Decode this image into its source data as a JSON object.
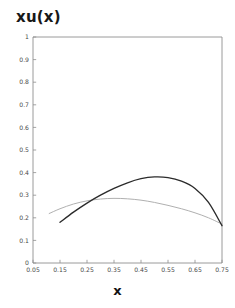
{
  "chart_data": {
    "type": "line",
    "title": "xu(x)",
    "xlabel": "x",
    "ylabel": "",
    "xlim": [
      0.05,
      0.75
    ],
    "ylim": [
      0,
      1
    ],
    "grid": false,
    "legend": "none",
    "xticks": [
      "0.05",
      "0.15",
      "0.25",
      "0.35",
      "0.45",
      "0.55",
      "0.65",
      "0.75"
    ],
    "xtick_values": [
      0.05,
      0.15,
      0.25,
      0.35,
      0.45,
      0.55,
      0.65,
      0.75
    ],
    "yticks": [
      "0",
      "0.1",
      "0.2",
      "0.3",
      "0.4",
      "0.5",
      "0.6",
      "0.7",
      "0.8",
      "0.9",
      "1"
    ],
    "ytick_values": [
      0,
      0.1,
      0.2,
      0.3,
      0.4,
      0.5,
      0.6,
      0.7,
      0.8,
      0.9,
      1
    ],
    "series": [
      {
        "name": "dark-curve",
        "color": "#2b2b2b",
        "x": [
          0.15,
          0.2,
          0.25,
          0.3,
          0.35,
          0.4,
          0.45,
          0.5,
          0.55,
          0.6,
          0.65,
          0.7,
          0.75
        ],
        "values": [
          0.18,
          0.225,
          0.265,
          0.3,
          0.33,
          0.355,
          0.373,
          0.381,
          0.378,
          0.362,
          0.33,
          0.268,
          0.165
        ]
      },
      {
        "name": "light-curve",
        "color": "#b0b0b0",
        "x": [
          0.11,
          0.15,
          0.2,
          0.25,
          0.3,
          0.35,
          0.4,
          0.45,
          0.5,
          0.55,
          0.6,
          0.65,
          0.7,
          0.75
        ],
        "values": [
          0.219,
          0.24,
          0.261,
          0.275,
          0.283,
          0.286,
          0.284,
          0.278,
          0.268,
          0.255,
          0.24,
          0.222,
          0.2,
          0.172
        ]
      }
    ]
  }
}
